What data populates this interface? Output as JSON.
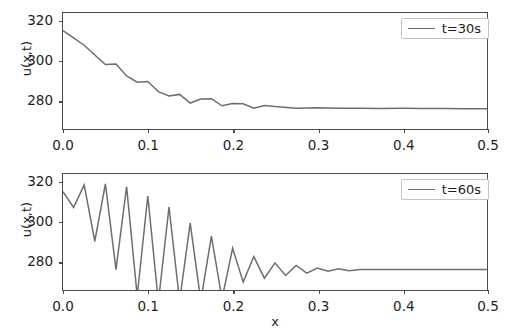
{
  "figure": {
    "background": "#ffffff",
    "line_color": "#6e6e6e",
    "frame_color": "#4b4b4b"
  },
  "axis": {
    "xlabel": "x",
    "ylabel": "u(x,t)",
    "xticks": [
      "0.0",
      "0.1",
      "0.2",
      "0.3",
      "0.4",
      "0.5"
    ],
    "yticks": [
      "280",
      "300",
      "320"
    ]
  },
  "legend": {
    "top": "t=30s",
    "bottom": "t=60s"
  },
  "chart_data": [
    {
      "type": "line",
      "title": "",
      "xlabel": "",
      "ylabel": "u(x,t)",
      "xlim": [
        0.0,
        0.5
      ],
      "ylim": [
        272,
        331
      ],
      "xticks": [
        0.0,
        0.1,
        0.2,
        0.3,
        0.4,
        0.5
      ],
      "yticks": [
        280,
        300,
        320
      ],
      "grid": false,
      "legend_position": "upper right",
      "series": [
        {
          "name": "t=30s",
          "color": "#6e6e6e",
          "x": [
            0.0,
            0.0125,
            0.025,
            0.0375,
            0.05,
            0.0625,
            0.075,
            0.0875,
            0.1,
            0.1125,
            0.125,
            0.1375,
            0.15,
            0.1625,
            0.175,
            0.1875,
            0.2,
            0.2125,
            0.225,
            0.2375,
            0.25,
            0.275,
            0.3,
            0.325,
            0.35,
            0.375,
            0.4,
            0.425,
            0.45,
            0.475,
            0.5
          ],
          "y": [
            322.0,
            318.4,
            314.6,
            309.6,
            304.8,
            305.0,
            299.0,
            295.8,
            296.2,
            291.0,
            288.8,
            289.6,
            285.2,
            287.2,
            287.4,
            283.8,
            285.0,
            284.8,
            282.6,
            284.0,
            283.4,
            282.6,
            282.8,
            282.5,
            282.6,
            282.4,
            282.5,
            282.4,
            282.4,
            282.3,
            282.3
          ]
        }
      ]
    },
    {
      "type": "line",
      "title": "",
      "xlabel": "x",
      "ylabel": "u(x,t)",
      "xlim": [
        0.0,
        0.5
      ],
      "ylim": [
        272,
        331
      ],
      "xticks": [
        0.0,
        0.1,
        0.2,
        0.3,
        0.4,
        0.5
      ],
      "yticks": [
        280,
        300,
        320
      ],
      "grid": false,
      "legend_position": "upper right",
      "note": "Oscillation troughs between x=0.09 and x=0.19 extend below the visible y-range and are clipped at the bottom axis.",
      "series": [
        {
          "name": "t=60s",
          "color": "#6e6e6e",
          "x": [
            0.0,
            0.0125,
            0.025,
            0.0375,
            0.05,
            0.0625,
            0.075,
            0.0875,
            0.1,
            0.1125,
            0.125,
            0.1375,
            0.15,
            0.1625,
            0.175,
            0.1875,
            0.2,
            0.2125,
            0.225,
            0.2375,
            0.25,
            0.2625,
            0.275,
            0.2875,
            0.3,
            0.3125,
            0.325,
            0.3375,
            0.35,
            0.375,
            0.4,
            0.425,
            0.45,
            0.475,
            0.5
          ],
          "y": [
            322.0,
            314.0,
            325.5,
            296.8,
            326.0,
            282.4,
            324.6,
            269.0,
            319.8,
            266.0,
            314.2,
            266.5,
            306.0,
            266.5,
            299.4,
            267.5,
            293.2,
            276.0,
            289.0,
            278.0,
            285.8,
            279.4,
            284.5,
            280.6,
            283.2,
            281.5,
            282.8,
            281.8,
            282.4,
            282.4,
            282.4,
            282.4,
            282.4,
            282.4,
            282.4
          ]
        }
      ]
    }
  ]
}
